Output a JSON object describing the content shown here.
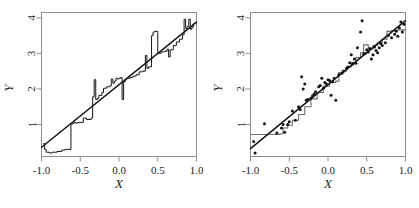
{
  "figure": {
    "background_color": "#ffffff",
    "frame_color": "#8d8d8d",
    "line_color": "#141414",
    "step_color": "#141414",
    "step_color_right": "#6e6e6e",
    "point_color": "#141414"
  },
  "panels": [
    {
      "id": "left-panel",
      "name": "left-plot"
    },
    {
      "id": "right-panel",
      "name": "right-plot"
    }
  ],
  "chart_data": [
    {
      "type": "line",
      "title": "",
      "xlabel": "X",
      "ylabel": "Y",
      "xlim": [
        -1.0,
        1.0
      ],
      "ylim": [
        0.1,
        4.15
      ],
      "xticks": [
        -1.0,
        -0.5,
        0.0,
        0.5,
        1.0
      ],
      "xticklabels": [
        "-1.0",
        "-0.5",
        "0.0",
        "0.5",
        "1.0"
      ],
      "yticks": [
        1,
        2,
        3,
        4
      ],
      "yticklabels": [
        "1",
        "2",
        "3",
        "4"
      ],
      "grid": false,
      "legend": "none",
      "series": [
        {
          "name": "regression-line",
          "type": "line",
          "x": [
            -1.0,
            1.0
          ],
          "y": [
            0.36,
            3.88
          ]
        },
        {
          "name": "step-function",
          "type": "step",
          "x": [
            -0.98,
            -0.96,
            -0.94,
            -0.92,
            -0.9,
            -0.86,
            -0.8,
            -0.74,
            -0.7,
            -0.62,
            -0.58,
            -0.56,
            -0.54,
            -0.5,
            -0.46,
            -0.42,
            -0.4,
            -0.36,
            -0.34,
            -0.32,
            -0.3,
            -0.28,
            -0.26,
            -0.22,
            -0.2,
            -0.16,
            -0.12,
            -0.1,
            -0.08,
            -0.06,
            -0.04,
            -0.02,
            0.0,
            0.02,
            0.04,
            0.06,
            0.08,
            0.1,
            0.14,
            0.18,
            0.22,
            0.26,
            0.3,
            0.34,
            0.36,
            0.38,
            0.42,
            0.44,
            0.46,
            0.5,
            0.54,
            0.58,
            0.62,
            0.64,
            0.66,
            0.7,
            0.74,
            0.78,
            0.82,
            0.84,
            0.86,
            0.88,
            0.9,
            0.92,
            0.94,
            0.96,
            0.98
          ],
          "y": [
            0.46,
            0.3,
            0.22,
            0.22,
            0.2,
            0.22,
            0.24,
            0.28,
            0.3,
            1.02,
            1.06,
            1.04,
            1.05,
            1.06,
            1.18,
            1.14,
            1.14,
            1.18,
            1.78,
            2.26,
            1.7,
            1.74,
            1.82,
            1.9,
            2.02,
            2.06,
            2.08,
            2.28,
            2.16,
            2.22,
            2.3,
            2.28,
            2.3,
            2.32,
            1.7,
            2.2,
            2.26,
            2.3,
            2.32,
            2.36,
            2.4,
            2.48,
            2.5,
            2.94,
            2.58,
            2.62,
            3.5,
            3.6,
            3.62,
            3.0,
            3.04,
            3.06,
            3.12,
            2.9,
            3.1,
            3.22,
            3.32,
            3.4,
            3.52,
            3.96,
            3.7,
            3.76,
            3.96,
            3.68,
            3.74,
            3.84,
            3.86
          ]
        }
      ]
    },
    {
      "type": "scatter",
      "title": "",
      "xlabel": "X",
      "ylabel": "Y",
      "xlim": [
        -1.0,
        1.0
      ],
      "ylim": [
        0.1,
        4.15
      ],
      "xticks": [
        -1.0,
        -0.5,
        0.0,
        0.5,
        1.0
      ],
      "xticklabels": [
        "-1.0",
        "-0.5",
        "0.0",
        "0.5",
        "1.0"
      ],
      "yticks": [
        1,
        2,
        3,
        4
      ],
      "yticklabels": [
        "1",
        "2",
        "3",
        "4"
      ],
      "grid": false,
      "legend": "none",
      "series": [
        {
          "name": "regression-line",
          "type": "line",
          "x": [
            -1.0,
            1.0
          ],
          "y": [
            0.32,
            3.92
          ]
        },
        {
          "name": "smooth-step",
          "type": "step",
          "x": [
            -1.0,
            -0.72,
            -0.62,
            -0.58,
            -0.52,
            -0.46,
            -0.38,
            -0.3,
            -0.22,
            -0.14,
            -0.06,
            0.02,
            0.1,
            0.14,
            0.18,
            0.24,
            0.3,
            0.36,
            0.42,
            0.46,
            0.52,
            0.58,
            0.64,
            0.7,
            0.76,
            0.82,
            0.9,
            1.0
          ],
          "y": [
            0.72,
            0.72,
            0.74,
            0.9,
            0.98,
            1.12,
            1.28,
            1.5,
            1.72,
            1.9,
            2.08,
            2.18,
            2.22,
            2.46,
            2.5,
            2.62,
            2.74,
            2.88,
            3.02,
            3.24,
            3.12,
            3.22,
            3.3,
            3.4,
            3.62,
            3.64,
            3.66,
            3.66
          ]
        },
        {
          "name": "observations",
          "type": "scatter",
          "x": [
            -0.96,
            -0.94,
            -0.82,
            -0.66,
            -0.6,
            -0.58,
            -0.56,
            -0.52,
            -0.5,
            -0.46,
            -0.42,
            -0.38,
            -0.36,
            -0.34,
            -0.32,
            -0.3,
            -0.28,
            -0.26,
            -0.22,
            -0.2,
            -0.18,
            -0.16,
            -0.12,
            -0.1,
            -0.08,
            -0.06,
            -0.04,
            -0.02,
            0.0,
            0.02,
            0.04,
            0.06,
            0.08,
            0.1,
            0.14,
            0.18,
            0.2,
            0.24,
            0.26,
            0.28,
            0.3,
            0.32,
            0.34,
            0.36,
            0.38,
            0.42,
            0.44,
            0.46,
            0.48,
            0.5,
            0.52,
            0.54,
            0.56,
            0.58,
            0.6,
            0.62,
            0.64,
            0.66,
            0.68,
            0.7,
            0.74,
            0.78,
            0.82,
            0.86,
            0.88,
            0.9,
            0.92,
            0.94,
            0.96,
            0.98
          ],
          "y": [
            0.52,
            0.2,
            1.02,
            0.76,
            0.9,
            1.0,
            0.78,
            1.0,
            1.08,
            1.38,
            1.12,
            1.5,
            1.42,
            2.34,
            2.0,
            2.14,
            1.68,
            1.7,
            1.74,
            1.8,
            1.86,
            1.92,
            2.06,
            2.1,
            2.3,
            2.02,
            2.18,
            2.14,
            2.26,
            2.24,
            1.82,
            2.2,
            2.3,
            1.68,
            2.4,
            2.44,
            2.5,
            2.58,
            2.62,
            2.74,
            2.96,
            2.7,
            2.84,
            2.72,
            3.16,
            3.6,
            3.92,
            2.98,
            3.0,
            3.1,
            3.04,
            3.14,
            2.84,
            2.96,
            3.18,
            3.08,
            3.02,
            3.16,
            3.28,
            3.22,
            3.3,
            3.5,
            3.44,
            3.54,
            3.62,
            3.48,
            3.72,
            3.88,
            3.6,
            3.82
          ]
        }
      ]
    }
  ]
}
